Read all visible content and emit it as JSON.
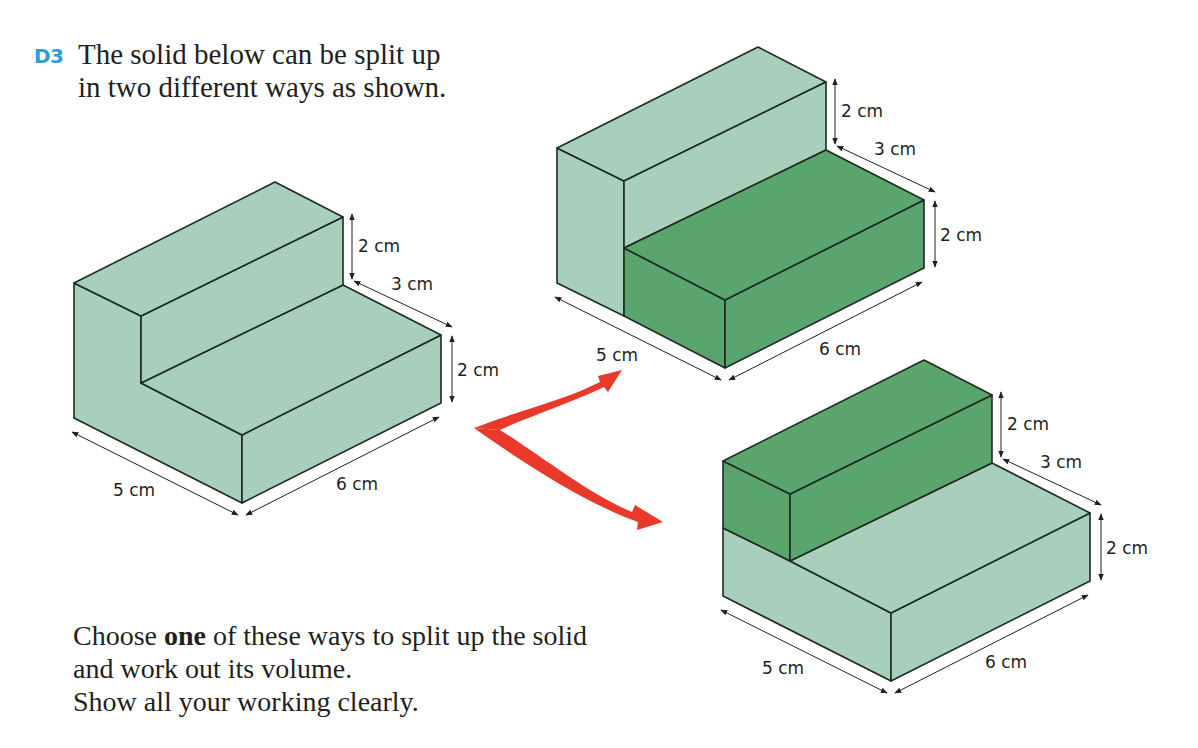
{
  "question": {
    "number": "D3",
    "text": "The solid below can be split up in two different ways as shown.",
    "line1": "The solid below can be split up",
    "line2": "in two different ways as shown."
  },
  "instructions": {
    "line1_pre": "Choose ",
    "line1_bold": "one",
    "line1_post": " of these ways to split up the solid",
    "line2": "and work out its volume.",
    "line3": "Show all your working clearly."
  },
  "colors": {
    "question_number": "#2e9bd6",
    "light_green": "#a8cfbb",
    "dark_green": "#5aa56e",
    "arrow_red": "#e8392a",
    "edge": "#1e2a22"
  },
  "figures": [
    {
      "name": "original-solid",
      "labels": {
        "top_height": "2 cm",
        "step_depth": "3 cm",
        "low_height": "2 cm",
        "width": "5 cm",
        "length": "6 cm"
      }
    },
    {
      "name": "split-horizontal-front",
      "highlight": "front lower cuboid",
      "labels": {
        "top_height": "2 cm",
        "step_depth": "3 cm",
        "low_height": "2 cm",
        "width": "5 cm",
        "length": "6 cm"
      }
    },
    {
      "name": "split-top-back",
      "highlight": "top back cuboid",
      "labels": {
        "top_height": "2 cm",
        "step_depth": "3 cm",
        "low_height": "2 cm",
        "width": "5 cm",
        "length": "6 cm"
      }
    }
  ]
}
